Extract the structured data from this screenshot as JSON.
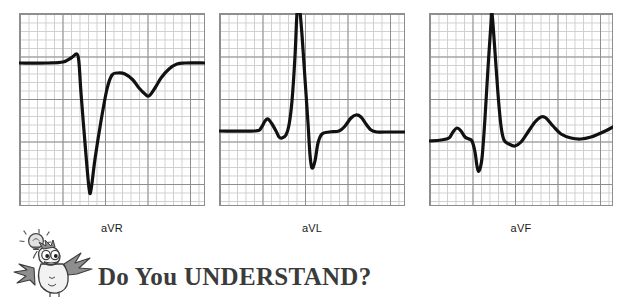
{
  "figure": {
    "type": "ecg-strip-set",
    "panels": [
      {
        "id": "avr",
        "label": "aVR",
        "description": "Lead aVR: small upright P, deep negative QS complex, inverted T wave",
        "grid": {
          "minor_squares_x": 22,
          "minor_squares_y": 23,
          "major_every": 5
        }
      },
      {
        "id": "avl",
        "label": "aVL",
        "description": "Lead aVL: small upright P, tall R wave, deep S wave, upright T wave",
        "grid": {
          "minor_squares_x": 22,
          "minor_squares_y": 23,
          "major_every": 5
        }
      },
      {
        "id": "avf",
        "label": "aVF",
        "description": "Lead aVF: upright P, small Q, tall R wave, broad upright T wave",
        "grid": {
          "minor_squares_x": 22,
          "minor_squares_y": 23,
          "major_every": 5
        }
      }
    ]
  },
  "banner": {
    "title": "Do You UNDERSTAND?",
    "icon": "thinking-bird-with-lightbulb-icon"
  },
  "colors": {
    "grid_minor": "#cfcfcf",
    "grid_major": "#8e8e8e",
    "trace": "#111111",
    "label_text": "#1a1a1a",
    "banner_text": "#3b3b3b",
    "background": "#ffffff"
  },
  "chart_data": {
    "type": "line",
    "title": "",
    "xlabel": "",
    "ylabel": "",
    "grid": true,
    "legend": "none",
    "panels": [
      {
        "name": "aVR",
        "baseline_y": 0,
        "xlim": [
          0,
          186
        ],
        "ylim": [
          -130,
          60
        ],
        "features": [
          {
            "wave": "P",
            "amplitude": 9,
            "polarity": "positive"
          },
          {
            "wave": "QS",
            "amplitude": -125,
            "polarity": "negative"
          },
          {
            "wave": "T",
            "amplitude": -25,
            "polarity": "inverted"
          }
        ],
        "points": [
          [
            0,
            0
          ],
          [
            30,
            0
          ],
          [
            44,
            -1
          ],
          [
            52,
            -5
          ],
          [
            58,
            -9
          ],
          [
            60,
            0
          ],
          [
            62,
            30
          ],
          [
            66,
            80
          ],
          [
            70,
            125
          ],
          [
            72,
            127
          ],
          [
            76,
            96
          ],
          [
            82,
            58
          ],
          [
            88,
            26
          ],
          [
            93,
            12
          ],
          [
            99,
            10
          ],
          [
            106,
            11
          ],
          [
            114,
            17
          ],
          [
            120,
            25
          ],
          [
            126,
            31
          ],
          [
            130,
            33
          ],
          [
            136,
            25
          ],
          [
            142,
            15
          ],
          [
            150,
            6
          ],
          [
            158,
            1
          ],
          [
            166,
            0
          ],
          [
            186,
            0
          ]
        ]
      },
      {
        "name": "aVL",
        "baseline_y": 0,
        "xlim": [
          0,
          186
        ],
        "ylim": [
          -60,
          130
        ],
        "features": [
          {
            "wave": "P",
            "amplitude": 12,
            "polarity": "positive"
          },
          {
            "wave": "R",
            "amplitude": 120,
            "polarity": "positive"
          },
          {
            "wave": "S",
            "amplitude": -38,
            "polarity": "negative"
          },
          {
            "wave": "T",
            "amplitude": 16,
            "polarity": "positive"
          }
        ],
        "points": [
          [
            0,
            0
          ],
          [
            36,
            0
          ],
          [
            42,
            3
          ],
          [
            46,
            10
          ],
          [
            49,
            12
          ],
          [
            53,
            7
          ],
          [
            57,
            0
          ],
          [
            60,
            -6
          ],
          [
            63,
            -7
          ],
          [
            67,
            -4
          ],
          [
            70,
            6
          ],
          [
            73,
            30
          ],
          [
            76,
            75
          ],
          [
            78,
            118
          ],
          [
            80,
            128
          ],
          [
            83,
            96
          ],
          [
            86,
            52
          ],
          [
            89,
            8
          ],
          [
            91,
            -24
          ],
          [
            93,
            -37
          ],
          [
            96,
            -30
          ],
          [
            99,
            -12
          ],
          [
            103,
            -3
          ],
          [
            110,
            -1
          ],
          [
            120,
            0
          ],
          [
            126,
            5
          ],
          [
            132,
            13
          ],
          [
            137,
            16
          ],
          [
            142,
            14
          ],
          [
            147,
            7
          ],
          [
            152,
            1
          ],
          [
            158,
            -1
          ],
          [
            166,
            -1
          ],
          [
            186,
            -1
          ]
        ]
      },
      {
        "name": "aVF",
        "baseline_y": 0,
        "xlim": [
          0,
          184
        ],
        "ylim": [
          -50,
          130
        ],
        "features": [
          {
            "wave": "P",
            "amplitude": 10,
            "polarity": "positive"
          },
          {
            "wave": "Q",
            "amplitude": -30,
            "polarity": "negative"
          },
          {
            "wave": "R",
            "amplitude": 122,
            "polarity": "positive"
          },
          {
            "wave": "T",
            "amplitude": 22,
            "polarity": "positive"
          }
        ],
        "points": [
          [
            0,
            -3
          ],
          [
            12,
            -2
          ],
          [
            20,
            0
          ],
          [
            24,
            6
          ],
          [
            28,
            10
          ],
          [
            32,
            7
          ],
          [
            36,
            1
          ],
          [
            40,
            -1
          ],
          [
            43,
            -3
          ],
          [
            46,
            -14
          ],
          [
            48,
            -28
          ],
          [
            50,
            -33
          ],
          [
            53,
            -20
          ],
          [
            56,
            20
          ],
          [
            59,
            70
          ],
          [
            62,
            115
          ],
          [
            63,
            125
          ],
          [
            66,
            86
          ],
          [
            69,
            44
          ],
          [
            72,
            12
          ],
          [
            75,
            -2
          ],
          [
            80,
            -6
          ],
          [
            86,
            -8
          ],
          [
            92,
            -4
          ],
          [
            99,
            6
          ],
          [
            106,
            16
          ],
          [
            112,
            21
          ],
          [
            117,
            20
          ],
          [
            124,
            12
          ],
          [
            132,
            4
          ],
          [
            142,
            0
          ],
          [
            152,
            -1
          ],
          [
            162,
            1
          ],
          [
            172,
            5
          ],
          [
            184,
            11
          ]
        ]
      }
    ]
  }
}
